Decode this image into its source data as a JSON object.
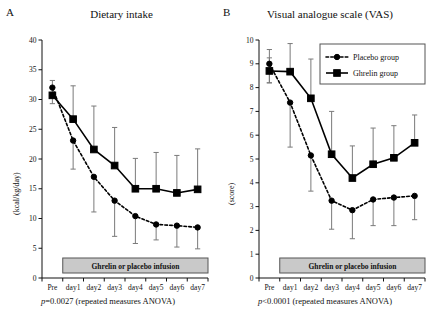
{
  "figure": {
    "panels": [
      {
        "label": "A",
        "title": "Dietary intake",
        "ylabel": "(kcal/kg/day)",
        "stat": "p=0.0027 (repeated measures ANOVA)",
        "stat_p": "p",
        "stat_rest": "=0.0027 (repeated measures ANOVA)",
        "infusion_label": "Ghrelin or placebo infusion"
      },
      {
        "label": "B",
        "title": "Visual analogue scale (VAS)",
        "ylabel": "(score)",
        "stat": "p<0.0001 (repeated measures ANOVA)",
        "stat_p": "p",
        "stat_rest": "<0.0001 (repeated measures ANOVA)",
        "infusion_label": "Ghrelin or placebo infusion"
      }
    ],
    "legend": {
      "position": "top-right-panel-b",
      "entries": [
        {
          "name": "Placebo group",
          "marker": "circle",
          "line": "dotted"
        },
        {
          "name": "Ghrelin group",
          "marker": "square",
          "line": "solid"
        }
      ]
    }
  },
  "chart_data": [
    {
      "type": "line",
      "panel": "A",
      "title": "Dietary intake",
      "xlabel": "",
      "ylabel": "(kcal/kg/day)",
      "categories": [
        "Pre",
        "day1",
        "day2",
        "day3",
        "day4",
        "day5",
        "day6",
        "day7"
      ],
      "ylim": [
        0,
        40
      ],
      "yticks": [
        0,
        5,
        10,
        15,
        20,
        25,
        30,
        35,
        40
      ],
      "grid": false,
      "annotation": "p=0.0027 (repeated measures ANOVA)",
      "span_annotation": "Ghrelin or placebo infusion",
      "series": [
        {
          "name": "Placebo group",
          "marker": "circle",
          "line": "dotted",
          "values": [
            32.0,
            23.1,
            17.0,
            13.0,
            10.4,
            9.0,
            8.8,
            8.5
          ],
          "err_low": [
            30.7,
            18.3,
            11.1,
            7.0,
            5.8,
            6.4,
            5.2,
            4.9
          ],
          "err_high": [
            33.2,
            23.1,
            17.0,
            13.0,
            10.4,
            9.0,
            8.8,
            8.5
          ]
        },
        {
          "name": "Ghrelin group",
          "marker": "square",
          "line": "solid",
          "values": [
            30.7,
            26.7,
            21.6,
            18.9,
            15.0,
            15.0,
            14.3,
            14.9
          ],
          "err_low": [
            29.3,
            26.7,
            21.6,
            18.9,
            15.0,
            15.0,
            14.3,
            14.9
          ],
          "err_high": [
            32.0,
            32.3,
            28.9,
            25.3,
            20.1,
            21.1,
            20.6,
            21.7
          ]
        }
      ]
    },
    {
      "type": "line",
      "panel": "B",
      "title": "Visual analogue scale (VAS)",
      "xlabel": "",
      "ylabel": "(score)",
      "categories": [
        "Pre",
        "day1",
        "day2",
        "day3",
        "day4",
        "day5",
        "day6",
        "day7"
      ],
      "ylim": [
        0,
        10
      ],
      "yticks": [
        0,
        1,
        2,
        3,
        4,
        5,
        6,
        7,
        8,
        9,
        10
      ],
      "grid": false,
      "annotation": "p<0.0001 (repeated measures ANOVA)",
      "span_annotation": "Ghrelin or placebo infusion",
      "series": [
        {
          "name": "Placebo group",
          "marker": "circle",
          "line": "dotted",
          "values": [
            9.0,
            7.37,
            5.15,
            3.25,
            2.85,
            3.3,
            3.38,
            3.45
          ],
          "err_low": [
            8.2,
            5.5,
            3.65,
            2.05,
            1.65,
            2.2,
            2.2,
            2.45
          ],
          "err_high": [
            9.6,
            7.37,
            5.15,
            3.25,
            2.85,
            3.3,
            3.38,
            3.45
          ]
        },
        {
          "name": "Ghrelin group",
          "marker": "square",
          "line": "solid",
          "values": [
            8.7,
            8.67,
            7.55,
            5.2,
            4.2,
            4.78,
            5.05,
            5.68
          ],
          "err_low": [
            8.2,
            8.67,
            7.55,
            5.2,
            4.2,
            4.78,
            5.05,
            5.68
          ],
          "err_high": [
            9.25,
            9.85,
            9.2,
            7.0,
            5.55,
            6.3,
            6.4,
            6.85
          ]
        }
      ]
    }
  ]
}
